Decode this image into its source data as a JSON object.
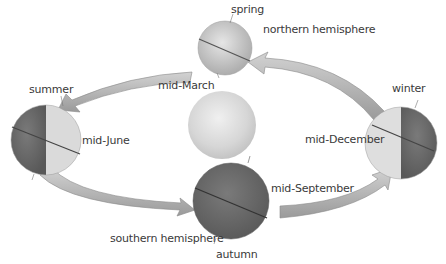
{
  "diagram": {
    "type": "earth-orbit-seasons",
    "sun": {
      "label": ""
    },
    "positions": [
      {
        "id": "spring",
        "season_label": "spring",
        "date_label": "mid-March",
        "extra_label": "northern hemisphere"
      },
      {
        "id": "summer",
        "season_label": "summer",
        "date_label": "mid-June"
      },
      {
        "id": "autumn",
        "season_label": "autumn",
        "date_label": "mid-September",
        "extra_label": "southern hemisphere"
      },
      {
        "id": "winter",
        "season_label": "winter",
        "date_label": "mid-December"
      }
    ],
    "colors": {
      "globe_light": "#d6d6d6",
      "globe_dark": "#6f6f6f",
      "arrow_fill": "#b8b8b8",
      "arrow_edge": "#8a8a8a",
      "sun": "#dcdcdc",
      "text": "#3a3a3a"
    }
  }
}
